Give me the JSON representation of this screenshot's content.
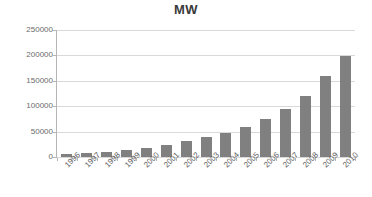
{
  "chart_data": {
    "type": "bar",
    "title": "MW",
    "xlabel": "",
    "ylabel": "",
    "categories": [
      "1996",
      "1997",
      "1998",
      "1999",
      "2000",
      "2001",
      "2002",
      "2003",
      "2004",
      "2005",
      "2006",
      "2007",
      "2008",
      "2009",
      "2010"
    ],
    "values": [
      6100,
      7600,
      10200,
      13600,
      17400,
      23900,
      31100,
      39400,
      47600,
      59000,
      74000,
      94000,
      121000,
      159000,
      198000
    ],
    "ylim": [
      0,
      250000
    ],
    "ytick_values": [
      0,
      50000,
      100000,
      150000,
      200000,
      250000
    ],
    "ytick_labels": [
      "0",
      "50000",
      "100000",
      "150000",
      "200000",
      "250000"
    ],
    "grid": true,
    "legend": "none",
    "bar_color": "#808080",
    "grid_color": "#d9d9d9",
    "axis_color": "#b5b5b5",
    "title_color": "#3a3a3a",
    "tick_label_color": "#6b6b6b",
    "background_color": "#ffffff"
  }
}
